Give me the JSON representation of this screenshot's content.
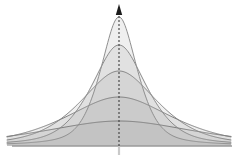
{
  "figure": {
    "background_color": "#ffffff",
    "width": 244,
    "height": 158
  },
  "axes": {
    "vertical_axis": {
      "name": "vertical-axis",
      "x": 119,
      "y_top": 12,
      "y_bottom": 146,
      "style": "dashed",
      "color": "#3f3f3f",
      "dash_pattern": "2,2",
      "width": 1.1,
      "has_arrowhead": true
    },
    "vertical_axis_stub": {
      "name": "vertical-axis-stub",
      "x": 119,
      "y_top": 146,
      "y_bottom": 155,
      "color": "#c9c9c9",
      "width": 2.2
    },
    "arrowhead": {
      "name": "axis-arrowhead",
      "tip_x": 119,
      "tip_y": 4,
      "half_width": 3.2,
      "height": 11,
      "color": "#1c1c1c"
    },
    "baseline": {
      "name": "horizontal-baseline",
      "y": 146,
      "x_start": 12,
      "x_end": 232,
      "color": "#9a9a9a",
      "width": 1.4
    }
  },
  "chart_data": {
    "type": "line",
    "subtitle": "Family of scaled peaked distributions sharing one mode",
    "xlabel": "",
    "ylabel": "",
    "grid": false,
    "legend": null,
    "xlim": [
      -1,
      1
    ],
    "ylim": [
      0,
      1
    ],
    "baseline_y_px": 146,
    "center_x_px": 119,
    "x_half_span_px": 112,
    "curve_count": 5,
    "series": [
      {
        "name": "curve-1-narrowest",
        "label": "Narrowest / tallest",
        "peak_height_px": 129,
        "peak_y_px": 17,
        "scale_px": 20,
        "shape_exponent": 2.0,
        "stroke": "#8f8f8f",
        "stroke_width": 1.0,
        "fill": "#9a9a9a",
        "fill_opacity": 0.16,
        "x": [
          -1.0,
          -0.8,
          -0.6,
          -0.45,
          -0.35,
          -0.25,
          -0.18,
          -0.12,
          -0.06,
          0.0,
          0.06,
          0.12,
          0.18,
          0.25,
          0.35,
          0.45,
          0.6,
          0.8,
          1.0
        ],
        "y": [
          0.01,
          0.015,
          0.025,
          0.045,
          0.08,
          0.17,
          0.33,
          0.58,
          0.87,
          1.0,
          0.87,
          0.58,
          0.33,
          0.17,
          0.08,
          0.045,
          0.025,
          0.015,
          0.01
        ]
      },
      {
        "name": "curve-2",
        "label": "Second",
        "peak_height_px": 101,
        "peak_y_px": 45,
        "scale_px": 30,
        "shape_exponent": 2.0,
        "stroke": "#8a8a8a",
        "stroke_width": 1.0,
        "fill": "#9a9a9a",
        "fill_opacity": 0.16,
        "x": [
          -1.0,
          -0.8,
          -0.6,
          -0.45,
          -0.35,
          -0.25,
          -0.18,
          -0.12,
          -0.06,
          0.0,
          0.06,
          0.12,
          0.18,
          0.25,
          0.35,
          0.45,
          0.6,
          0.8,
          1.0
        ],
        "y": [
          0.02,
          0.03,
          0.05,
          0.09,
          0.15,
          0.29,
          0.47,
          0.7,
          0.92,
          1.0,
          0.92,
          0.7,
          0.47,
          0.29,
          0.15,
          0.09,
          0.05,
          0.03,
          0.02
        ]
      },
      {
        "name": "curve-3",
        "label": "Middle",
        "peak_height_px": 75,
        "peak_y_px": 71,
        "scale_px": 42,
        "shape_exponent": 2.0,
        "stroke": "#868686",
        "stroke_width": 1.0,
        "fill": "#9a9a9a",
        "fill_opacity": 0.16,
        "x": [
          -1.0,
          -0.8,
          -0.6,
          -0.45,
          -0.35,
          -0.25,
          -0.18,
          -0.12,
          -0.06,
          0.0,
          0.06,
          0.12,
          0.18,
          0.25,
          0.35,
          0.45,
          0.6,
          0.8,
          1.0
        ],
        "y": [
          0.04,
          0.06,
          0.1,
          0.16,
          0.25,
          0.42,
          0.6,
          0.79,
          0.95,
          1.0,
          0.95,
          0.79,
          0.6,
          0.42,
          0.25,
          0.16,
          0.1,
          0.06,
          0.04
        ]
      },
      {
        "name": "curve-4",
        "label": "Fourth",
        "peak_height_px": 49,
        "peak_y_px": 97,
        "scale_px": 58,
        "shape_exponent": 2.0,
        "stroke": "#828282",
        "stroke_width": 1.0,
        "fill": "#9a9a9a",
        "fill_opacity": 0.16,
        "x": [
          -1.0,
          -0.8,
          -0.6,
          -0.45,
          -0.35,
          -0.25,
          -0.18,
          -0.12,
          -0.06,
          0.0,
          0.06,
          0.12,
          0.18,
          0.25,
          0.35,
          0.45,
          0.6,
          0.8,
          1.0
        ],
        "y": [
          0.08,
          0.12,
          0.19,
          0.28,
          0.39,
          0.57,
          0.72,
          0.86,
          0.97,
          1.0,
          0.97,
          0.86,
          0.72,
          0.57,
          0.39,
          0.28,
          0.19,
          0.12,
          0.08
        ]
      },
      {
        "name": "curve-5-widest",
        "label": "Widest / flattest",
        "peak_height_px": 25,
        "peak_y_px": 121,
        "scale_px": 84,
        "shape_exponent": 2.0,
        "stroke": "#7e7e7e",
        "stroke_width": 1.0,
        "fill": "#9a9a9a",
        "fill_opacity": 0.16,
        "x": [
          -1.0,
          -0.8,
          -0.6,
          -0.45,
          -0.35,
          -0.25,
          -0.18,
          -0.12,
          -0.06,
          0.0,
          0.06,
          0.12,
          0.18,
          0.25,
          0.35,
          0.45,
          0.6,
          0.8,
          1.0
        ],
        "y": [
          0.18,
          0.26,
          0.38,
          0.5,
          0.61,
          0.75,
          0.85,
          0.93,
          0.99,
          1.0,
          0.99,
          0.93,
          0.85,
          0.75,
          0.61,
          0.5,
          0.38,
          0.26,
          0.18
        ]
      }
    ]
  },
  "colors": {
    "background": "#ffffff",
    "fill_gray": "#9a9a9a",
    "stroke_gray": "#868686",
    "axis_dark": "#3f3f3f",
    "axis_light": "#c9c9c9",
    "baseline": "#9a9a9a",
    "arrow": "#1c1c1c"
  }
}
